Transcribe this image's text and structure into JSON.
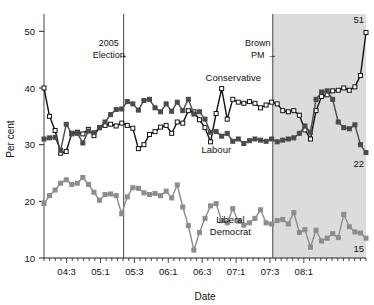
{
  "chart_data": {
    "type": "line",
    "title": "",
    "xlabel": "Date",
    "ylabel": "Per cent",
    "ylim": [
      10,
      52
    ],
    "yticks": [
      10,
      20,
      30,
      40,
      50
    ],
    "xlim": [
      0,
      57
    ],
    "xtick_labels": [
      "04:3",
      "05:1",
      "05:3",
      "06:1",
      "06:3",
      "07:1",
      "07:3",
      "08:1"
    ],
    "xtick_positions": [
      4,
      10,
      16,
      22,
      28,
      34,
      40,
      46
    ],
    "grid": false,
    "legend": "inline-labels",
    "minor_ticks": true,
    "series": [
      {
        "name": "Conservative",
        "color": "#111111",
        "marker": "open-square",
        "marker_fill": "#ffffff",
        "label_x": 33.5,
        "label_y": 41.2,
        "end_label": "51",
        "values": [
          40.0,
          35.0,
          32.5,
          28.5,
          28.8,
          32.0,
          32.2,
          31.9,
          32.7,
          31.6,
          33.0,
          33.4,
          33.6,
          33.3,
          33.8,
          33.4,
          32.9,
          29.3,
          30.0,
          31.8,
          32.3,
          33.1,
          33.4,
          32.0,
          34.0,
          33.8,
          36.0,
          35.8,
          34.4,
          33.0,
          30.5,
          35.5,
          39.9,
          34.5,
          38.0,
          37.5,
          37.3,
          37.6,
          37.3,
          36.5,
          37.0,
          37.5,
          37.2,
          36.0,
          35.8,
          36.0,
          35.2,
          32.6,
          31.0,
          36.0,
          38.5,
          38.8,
          39.5,
          39.6,
          40.0,
          39.6,
          40.2,
          42.2,
          49.8
        ]
      },
      {
        "name": "Labour",
        "color": "#4a4a4a",
        "marker": "filled-square",
        "marker_fill": "#4a4a4a",
        "label_x": 30.5,
        "label_y": 28.5,
        "values": [
          31.0,
          31.2,
          31.3,
          29.0,
          33.6,
          31.9,
          32.0,
          30.3,
          32.4,
          32.1,
          33.0,
          34.0,
          35.3,
          36.2,
          36.3,
          37.6,
          37.2,
          36.1,
          37.8,
          38.0,
          36.5,
          35.8,
          37.2,
          35.9,
          37.5,
          36.0,
          38.0,
          35.4,
          35.8,
          34.5,
          32.2,
          32.3,
          31.5,
          32.0,
          30.6,
          31.0,
          30.2,
          30.7,
          31.0,
          30.8,
          30.6,
          31.0,
          30.5,
          30.8,
          31.0,
          31.2,
          32.0,
          33.3,
          32.2,
          38.0,
          39.3,
          39.5,
          38.0,
          34.0,
          33.0,
          32.8,
          33.5,
          30.0,
          28.6
        ]
      },
      {
        "name": "Liberal Democrat",
        "color": "#8c8c8c",
        "marker": "filled-square",
        "marker_fill": "#8c8c8c",
        "label_x": 33.0,
        "label_y": 16.2,
        "end_label": "15",
        "values": [
          19.6,
          21.0,
          22.0,
          23.2,
          23.8,
          23.0,
          23.2,
          24.2,
          23.0,
          21.6,
          20.2,
          21.2,
          21.3,
          21.0,
          17.8,
          20.8,
          22.4,
          22.3,
          21.5,
          21.2,
          21.4,
          21.0,
          21.8,
          20.6,
          22.9,
          19.0,
          15.7,
          11.4,
          14.5,
          17.0,
          19.2,
          19.6,
          16.6,
          16.2,
          18.7,
          16.5,
          15.8,
          16.2,
          17.0,
          18.5,
          16.2,
          16.0,
          16.6,
          16.8,
          16.0,
          18.0,
          14.5,
          15.0,
          11.9,
          14.9,
          13.0,
          13.5,
          14.3,
          13.6,
          17.7,
          15.5,
          14.6,
          14.4,
          13.5
        ]
      }
    ],
    "labour_end_label": "22",
    "annotations": [
      {
        "id": "election-2005",
        "line1": "2005",
        "line2": "Election",
        "arrow": "→",
        "x": 14.1
      },
      {
        "id": "brown-pm",
        "line1": "Brown",
        "line2": "PM",
        "arrow": "→",
        "x": 40.5
      }
    ],
    "shaded_region": {
      "from": 40.5,
      "to": 57,
      "color": "#dcdcdc"
    }
  }
}
